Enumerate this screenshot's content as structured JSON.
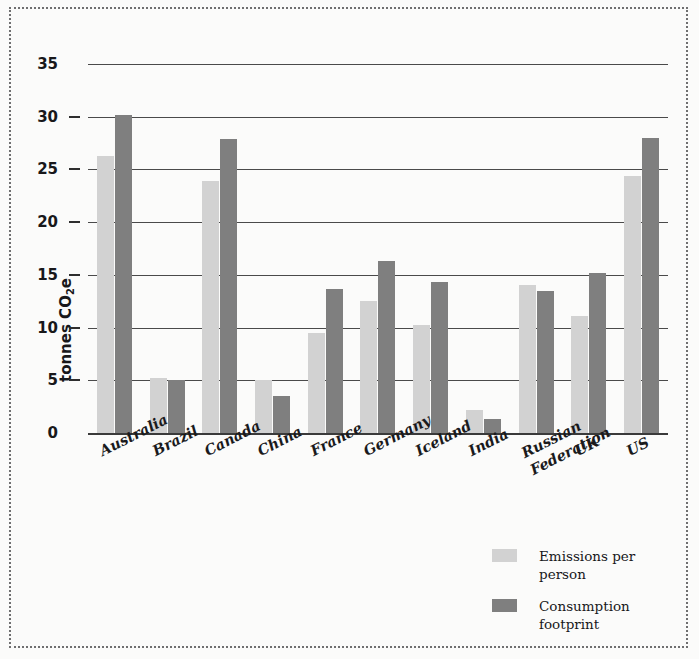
{
  "chart_data": {
    "type": "bar",
    "title": "",
    "subtitle": "",
    "xlabel": "",
    "ylabel": "tonnes CO2e",
    "ylabel_parts": {
      "prefix": "tonnes CO",
      "sub": "2",
      "suffix": "e"
    },
    "ylim": [
      0,
      35
    ],
    "ytick_values": [
      0,
      5,
      10,
      15,
      20,
      25,
      30,
      35
    ],
    "ytick_labels": [
      "0",
      "5",
      "10",
      "15",
      "20",
      "25",
      "30",
      "35"
    ],
    "grid": true,
    "grid_axis": "y",
    "legend_position": "bottom-right",
    "categories": [
      "Australia",
      "Brazil",
      "Canada",
      "China",
      "France",
      "Germany",
      "Iceland",
      "India",
      "Russian\nFederation",
      "UK",
      "US"
    ],
    "series": [
      {
        "name": "Emissions per person",
        "color": "#d2d2d2",
        "values": [
          26.3,
          5.2,
          23.9,
          5.0,
          9.5,
          12.5,
          10.2,
          2.2,
          14.0,
          11.1,
          24.4
        ]
      },
      {
        "name": "Consumption footprint",
        "name_wrapped": "Consumption\nfootprint",
        "color": "#7f7f7f",
        "values": [
          30.2,
          5.0,
          27.9,
          3.5,
          13.7,
          16.3,
          14.3,
          1.3,
          13.5,
          15.2,
          28.0
        ]
      }
    ]
  },
  "legend": {
    "items": [
      {
        "label": "Emissions per person",
        "color": "#d2d2d2"
      },
      {
        "label": "Consumption\nfootprint",
        "color": "#7f7f7f"
      }
    ]
  },
  "colors": {
    "light_bar": "#d2d2d2",
    "dark_bar": "#7f7f7f",
    "gridline": "#4a4a4a",
    "text": "#18181a",
    "frame_border": "#6f6f70",
    "background": "#fbfbfa"
  }
}
